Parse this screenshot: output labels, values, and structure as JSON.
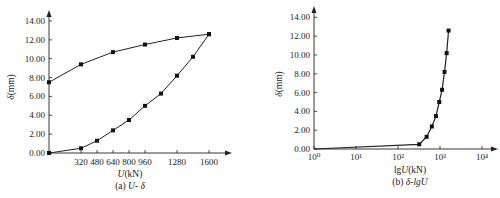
{
  "chart_data": [
    {
      "type": "line",
      "title": "(a) U- δ",
      "caption_prefix": "(a) ",
      "caption_var": "U- δ",
      "xlabel": "U(kN)",
      "ylabel": "δ(mm)",
      "xlim": [
        0,
        1700
      ],
      "ylim": [
        0,
        14.5
      ],
      "xticks": [
        320,
        480,
        640,
        800,
        960,
        1280,
        1600
      ],
      "xtick_labels": [
        "320",
        "480",
        "640",
        "800",
        "960",
        "1280",
        "1600"
      ],
      "yticks": [
        0,
        2,
        4,
        6,
        8,
        10,
        12,
        14
      ],
      "ytick_labels": [
        "0.00",
        "2.00",
        "4.00",
        "6.00",
        "8.00",
        "10.00",
        "12.00",
        "14.00"
      ],
      "grid": false,
      "legend": null,
      "marker": "square",
      "series": [
        {
          "name": "loading",
          "x": [
            0,
            320,
            480,
            640,
            800,
            960,
            1120,
            1280,
            1440,
            1600
          ],
          "y": [
            0.0,
            0.5,
            1.3,
            2.4,
            3.5,
            5.0,
            6.3,
            8.2,
            10.2,
            12.6
          ]
        },
        {
          "name": "unloading",
          "x": [
            1600,
            1280,
            960,
            640,
            320,
            0
          ],
          "y": [
            12.6,
            12.2,
            11.5,
            10.7,
            9.4,
            7.5
          ]
        }
      ]
    },
    {
      "type": "line",
      "title": "(b) δ-lgU",
      "caption_prefix": "(b) ",
      "caption_var": "δ-lgU",
      "xlabel": "lgU(kN)",
      "ylabel": "δ(mm)",
      "xscale": "log",
      "xlim": [
        1,
        10000
      ],
      "ylim": [
        0,
        14.5
      ],
      "xticks": [
        1,
        10,
        100,
        1000,
        10000
      ],
      "xtick_labels": [
        "10⁰",
        "10¹",
        "10²",
        "10³",
        "10⁴"
      ],
      "yticks": [
        0,
        2,
        4,
        6,
        8,
        10,
        12,
        14
      ],
      "ytick_labels": [
        "0.00",
        "2.00",
        "4.00",
        "6.00",
        "8.00",
        "10.00",
        "12.00",
        "14.00"
      ],
      "grid": false,
      "legend": null,
      "marker": "square",
      "series": [
        {
          "name": "loading",
          "x": [
            1,
            320,
            480,
            640,
            800,
            960,
            1120,
            1280,
            1440,
            1600
          ],
          "y": [
            0.0,
            0.5,
            1.3,
            2.4,
            3.5,
            5.0,
            6.3,
            8.2,
            10.2,
            12.6
          ]
        }
      ]
    }
  ]
}
